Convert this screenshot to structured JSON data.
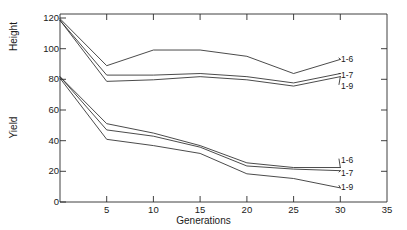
{
  "chart_data": {
    "type": "line",
    "title": "",
    "subtitle": "",
    "xlabel": "Generations",
    "ylabel": "",
    "xlim": [
      0,
      35
    ],
    "ylim": [
      0,
      120
    ],
    "grid": false,
    "legend_position": "right-inline",
    "xticks": [
      0,
      5,
      10,
      15,
      20,
      25,
      30,
      35
    ],
    "xticklabels": [
      "",
      "5",
      "10",
      "15",
      "20",
      "25",
      "30",
      "35"
    ],
    "yticks": [
      0,
      20,
      40,
      60,
      80,
      100,
      120
    ],
    "yticklabels": [
      "0",
      "20",
      "40",
      "60",
      "80",
      "100",
      "120"
    ],
    "panel_labels": [
      {
        "name": "height-axis-label",
        "text": "Height"
      },
      {
        "name": "yield-axis-label",
        "text": "Yield"
      }
    ],
    "x": [
      0,
      5,
      10,
      15,
      20,
      25,
      30
    ],
    "groups": [
      {
        "group": "Height",
        "series": [
          {
            "name": "1-6",
            "label": "1-6",
            "values": [
              117,
              87,
              97,
              97,
              93,
              82,
              91
            ]
          },
          {
            "name": "1-7",
            "label": "1-7",
            "values": [
              116,
              81,
              81,
              82,
              80,
              76,
              82
            ]
          },
          {
            "name": "1-9",
            "label": "1-9",
            "values": [
              116,
              77,
              78,
              80,
              78,
              74,
              80
            ]
          }
        ]
      },
      {
        "group": "Yield",
        "series": [
          {
            "name": "1-6",
            "label": "1-6",
            "values": [
              80,
              50,
              44,
              36,
              25,
              22,
              22
            ]
          },
          {
            "name": "1-7",
            "label": "1-7",
            "values": [
              80,
              46,
              42,
              35,
              23,
              21,
              20
            ]
          },
          {
            "name": "1-9",
            "label": "1-9",
            "values": [
              79,
              40,
              36,
              31,
              18,
              15,
              9
            ]
          }
        ]
      }
    ],
    "colors": {
      "line": "#2b2b2b",
      "axis": "#2b2b2b",
      "background": "#ffffff"
    }
  },
  "labels": {
    "height": "Height",
    "yield": "Yield",
    "generations": "Generations",
    "height_1_6": "1-6",
    "height_1_7": "1-7",
    "height_1_9": "1-9",
    "yield_1_6": "1-6",
    "yield_1_7": "1-7",
    "yield_1_9": "1-9",
    "y_0": "0",
    "y_20": "20",
    "y_40": "40",
    "y_60": "60",
    "y_80": "80",
    "y_100": "100",
    "y_120": "120",
    "x_5": "5",
    "x_10": "10",
    "x_15": "15",
    "x_20": "20",
    "x_25": "25",
    "x_30": "30",
    "x_35": "35"
  }
}
